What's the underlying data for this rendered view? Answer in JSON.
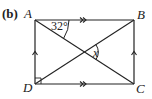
{
  "part_label": "(b)",
  "vertices": {
    "A": {
      "label": "A"
    },
    "B": {
      "label": "B"
    },
    "C": {
      "label": "C"
    },
    "D": {
      "label": "D"
    }
  },
  "angles": {
    "given": "32°",
    "unknown": "x"
  },
  "colors": {
    "stroke": "#222222",
    "background": "#ffffff"
  }
}
